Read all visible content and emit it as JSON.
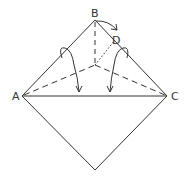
{
  "diagram": {
    "type": "origami-fold-instruction",
    "colors": {
      "stroke": "#333333",
      "background": "#ffffff"
    },
    "points": {
      "A": {
        "label": "A",
        "x": 22,
        "y": 96
      },
      "B": {
        "label": "B",
        "x": 95,
        "y": 20
      },
      "C": {
        "label": "C",
        "x": 167,
        "y": 96
      },
      "D": {
        "label": "D",
        "x": 115,
        "y": 38
      }
    },
    "labels": {
      "A": "A",
      "B": "B",
      "C": "C",
      "D": "D"
    }
  }
}
